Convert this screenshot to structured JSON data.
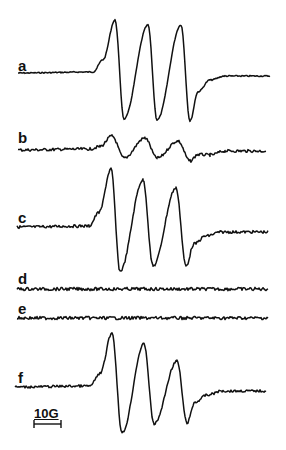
{
  "chart_data": {
    "type": "line",
    "title": "",
    "xlabel": "Magnetic field",
    "ylabel": "",
    "grid": false,
    "legend": "none",
    "scale_bar": {
      "label": "10G",
      "x1": 34,
      "x2": 61,
      "y": 424
    },
    "series": [
      {
        "name": "a",
        "label_pos": [
          18,
          58
        ],
        "baseline": 73,
        "start_x": 18,
        "end": [
          270,
          76
        ],
        "peaks": [
          [
            115,
            20
          ],
          [
            148,
            25
          ],
          [
            181,
            25
          ]
        ],
        "troughs": [
          [
            124,
            119
          ],
          [
            157,
            120
          ],
          [
            190,
            121
          ]
        ],
        "noise": 0.6,
        "amplitude_relative": 1.0
      },
      {
        "name": "b",
        "label_pos": [
          18,
          130
        ],
        "baseline": 150,
        "start_x": 18,
        "end": [
          266,
          151
        ],
        "peaks": [
          [
            112,
            136
          ],
          [
            145,
            138
          ],
          [
            178,
            141
          ]
        ],
        "troughs": [
          [
            124,
            158
          ],
          [
            157,
            158
          ],
          [
            190,
            161
          ]
        ],
        "noise": 1.4,
        "amplitude_relative": 0.22
      },
      {
        "name": "c",
        "label_pos": [
          18,
          210
        ],
        "baseline": 227,
        "start_x": 17,
        "end": [
          268,
          232
        ],
        "peaks": [
          [
            111,
            169
          ],
          [
            143,
            180
          ],
          [
            176,
            188
          ]
        ],
        "troughs": [
          [
            120,
            271
          ],
          [
            153,
            266
          ],
          [
            186,
            266
          ]
        ],
        "noise": 1.4,
        "amplitude_relative": 0.9
      },
      {
        "name": "d",
        "label_pos": [
          18,
          271
        ],
        "baseline": 289,
        "start_x": 17,
        "end": [
          268,
          289
        ],
        "peaks": [],
        "troughs": [],
        "noise": 1.6,
        "amplitude_relative": 0.0
      },
      {
        "name": "e",
        "label_pos": [
          18,
          301
        ],
        "baseline": 318,
        "start_x": 17,
        "end": [
          268,
          318
        ],
        "peaks": [],
        "troughs": [],
        "noise": 1.6,
        "amplitude_relative": 0.0
      },
      {
        "name": "f",
        "label_pos": [
          18,
          370
        ],
        "baseline": 387,
        "start_x": 15,
        "end": [
          266,
          391
        ],
        "peaks": [
          [
            112,
            333
          ],
          [
            144,
            344
          ],
          [
            177,
            361
          ]
        ],
        "troughs": [
          [
            122,
            433
          ],
          [
            154,
            424
          ],
          [
            187,
            423
          ]
        ],
        "noise": 1.2,
        "amplitude_relative": 0.9
      }
    ]
  },
  "style": {
    "line_color": "#111111",
    "background": "#ffffff"
  }
}
